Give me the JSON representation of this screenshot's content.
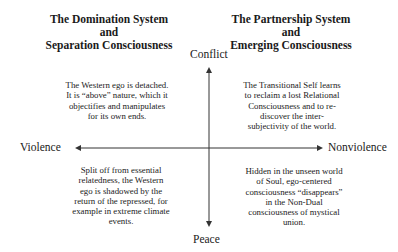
{
  "headers": {
    "left": [
      "The Domination System and",
      "Separation Consciousness"
    ],
    "right": [
      "The Partnership System and",
      "Emerging Consciousness"
    ]
  },
  "axes": {
    "top": "Conflict",
    "bottom": "Peace",
    "left": "Violence",
    "right": "Nonviolence"
  },
  "quadrants": {
    "top_left": "The Western ego is detached. It is “above” nature, which it objectifies and manipulates for its own ends.",
    "top_right": "The Transitional Self learns to reclaim a lost Relational Consciousness and to re-discover the inter-subjectivity of the world.",
    "bottom_left": "Split off from essential relatedness, the Western ego is shadowed by the return of the repressed, for example in extreme climate events.",
    "bottom_right": "Hidden in the unseen world of Soul, ego-centered consciousness “disappears” in the Non-Dual consciousness of mystical union."
  },
  "colors": {
    "axis": "#333333",
    "text": "#1a1a1a"
  }
}
